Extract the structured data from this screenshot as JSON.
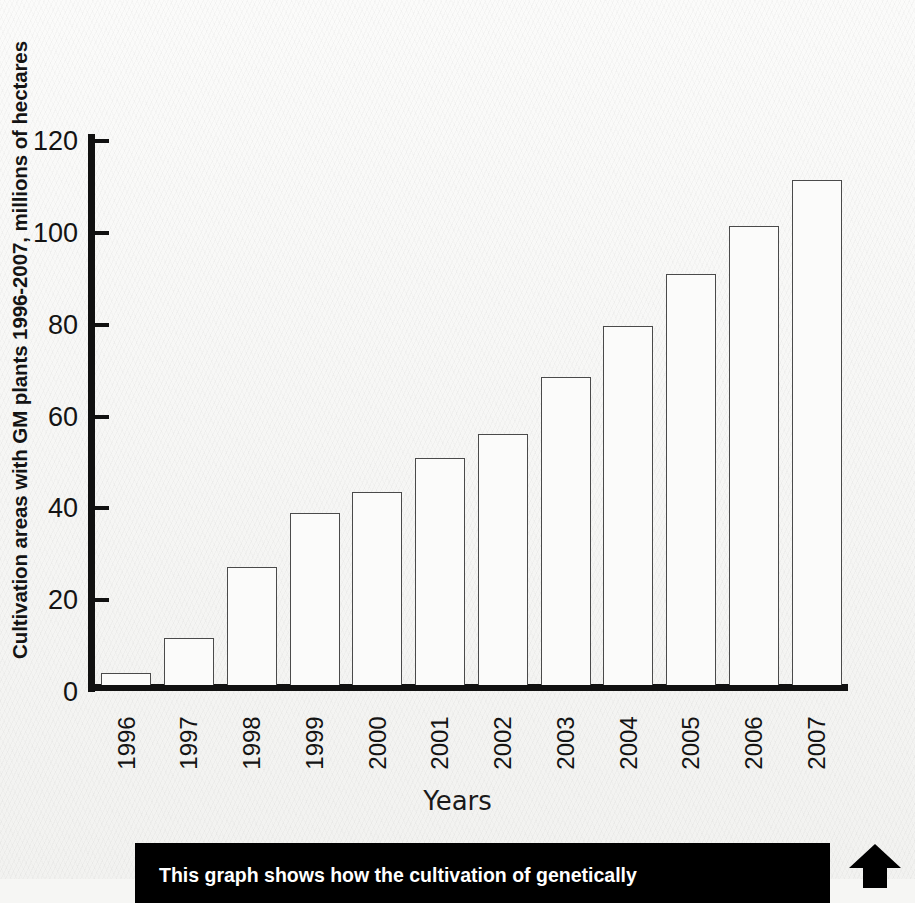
{
  "chart_data": {
    "type": "bar",
    "title": "",
    "ylabel": "Cultivation areas with GM plants 1996-2007, millions of hectares",
    "xlabel": "Years",
    "categories": [
      "1996",
      "1997",
      "1998",
      "1999",
      "2000",
      "2001",
      "2002",
      "2003",
      "2004",
      "2005",
      "2006",
      "2007"
    ],
    "values": [
      2.6,
      10.3,
      25.6,
      37.5,
      42.0,
      49.5,
      54.7,
      67.0,
      78.2,
      89.5,
      100.0,
      110.0
    ],
    "ylim": [
      0,
      120
    ],
    "yticks": [
      0,
      20,
      40,
      60,
      80,
      100,
      120
    ],
    "ytick_labels": [
      "0",
      "20",
      "40",
      "60",
      "80",
      "100",
      "120"
    ],
    "grid": false,
    "legend": null,
    "series": [
      {
        "name": "Cultivation area (millions of hectares)",
        "values": [
          2.6,
          10.3,
          25.6,
          37.5,
          42.0,
          49.5,
          54.7,
          67.0,
          78.2,
          89.5,
          100.0,
          110.0
        ]
      }
    ],
    "bar_fill_color": "#fbfbfa",
    "bar_edge_color": "#4a4a4a",
    "axis_color": "#111111"
  },
  "caption": {
    "text": "This graph shows how the cultivation of genetically",
    "background_color": "#000000",
    "text_color": "#ffffff",
    "arrow_icon": "up-arrow-icon"
  }
}
